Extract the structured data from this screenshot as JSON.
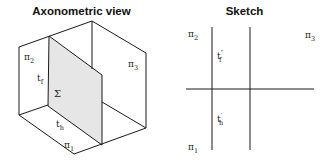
{
  "axonometric": {
    "title": "Axonometric view",
    "labels": {
      "pi2": {
        "base": "π",
        "sub": "2"
      },
      "pi3": {
        "base": "π",
        "sub": "3"
      },
      "pi1": {
        "base": "π",
        "sub": "1"
      },
      "tf": {
        "base": "t",
        "sub": "f"
      },
      "th": {
        "base": "t",
        "sub": "h"
      },
      "sigma": "Σ"
    },
    "colors": {
      "line": "#1a1a1a",
      "plane_fill": "#e6e6e6"
    }
  },
  "sketch": {
    "title": "Sketch",
    "labels": {
      "pi2": {
        "base": "π",
        "sub": "2"
      },
      "pi3": {
        "base": "π",
        "sub": "3"
      },
      "pi1": {
        "base": "π",
        "sub": "1"
      },
      "tf2": {
        "base": "t",
        "sub": "f",
        "sup": "″"
      },
      "th1": {
        "base": "t",
        "sub": "h",
        "sup": "′"
      }
    },
    "colors": {
      "line": "#1a1a1a"
    }
  }
}
